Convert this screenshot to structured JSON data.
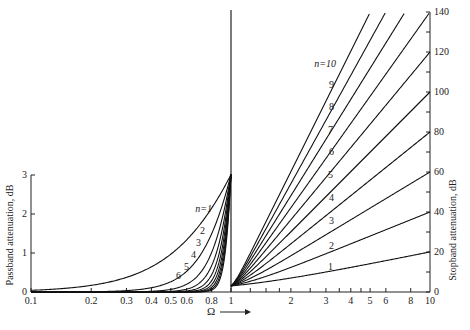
{
  "chart_data": {
    "type": "line",
    "title": "",
    "xlabel": "Ω",
    "formula": "A(Ω) = 10·log10(1 + Ω^(2n)) dB (Butterworth)",
    "panels": [
      {
        "name": "passband",
        "ylabel": "Passband attenuation, dB",
        "x_scale": "log",
        "xlim": [
          0.1,
          1
        ],
        "ylim": [
          0,
          3
        ],
        "x_ticks": [
          0.1,
          0.2,
          0.3,
          0.4,
          0.5,
          0.6,
          0.8,
          1
        ],
        "x_tick_labels": [
          "0.1",
          "0.2",
          "0.3",
          "0.4",
          "0.5",
          "0.6",
          "0.8",
          "1"
        ],
        "y_ticks": [
          0,
          1,
          2,
          3
        ],
        "y_tick_labels": [
          "0",
          "1",
          "2",
          "3"
        ],
        "series": [
          {
            "name": "n=1",
            "n": 1,
            "values_at_ticks": [
              0.04,
              0.17,
              0.37,
              0.64,
              0.97,
              1.34,
              2.15,
              3.01
            ]
          },
          {
            "name": "2",
            "n": 2,
            "values_at_ticks": [
              0.0,
              0.01,
              0.04,
              0.11,
              0.26,
              0.53,
              1.35,
              3.01
            ]
          },
          {
            "name": "3",
            "n": 3,
            "values_at_ticks": [
              0.0,
              0.0,
              0.0,
              0.02,
              0.07,
              0.2,
              0.9,
              3.01
            ]
          },
          {
            "name": "4",
            "n": 4,
            "values_at_ticks": [
              0.0,
              0.0,
              0.0,
              0.0,
              0.02,
              0.07,
              0.6,
              3.01
            ]
          },
          {
            "name": "5",
            "n": 5,
            "values_at_ticks": [
              0.0,
              0.0,
              0.0,
              0.0,
              0.0,
              0.03,
              0.39,
              3.01
            ]
          },
          {
            "name": "6",
            "n": 6,
            "values_at_ticks": [
              0.0,
              0.0,
              0.0,
              0.0,
              0.0,
              0.01,
              0.25,
              3.01
            ]
          }
        ],
        "curve_labels": [
          {
            "text": "n=1",
            "n": 1
          },
          {
            "text": "2",
            "n": 2
          },
          {
            "text": "3",
            "n": 3
          },
          {
            "text": "4",
            "n": 4
          },
          {
            "text": "5",
            "n": 5
          },
          {
            "text": "6",
            "n": 6
          }
        ],
        "extra_curves_n": [
          7,
          8,
          9,
          10
        ]
      },
      {
        "name": "stopband",
        "ylabel": "Stopband attenuation, dB",
        "x_scale": "log",
        "xlim": [
          1,
          10
        ],
        "ylim": [
          0,
          140
        ],
        "x_ticks": [
          1,
          2,
          3,
          4,
          5,
          6,
          8,
          10
        ],
        "x_tick_labels": [
          "1",
          "2",
          "3",
          "4",
          "5",
          "6",
          "8",
          "10"
        ],
        "y_ticks": [
          0,
          20,
          40,
          60,
          80,
          100,
          120,
          140
        ],
        "y_tick_labels": [
          "0",
          "20",
          "40",
          "60",
          "80",
          "100",
          "120",
          "140"
        ],
        "series": [
          {
            "name": "1",
            "n": 1,
            "value_at_10": 20
          },
          {
            "name": "2",
            "n": 2,
            "value_at_10": 40
          },
          {
            "name": "3",
            "n": 3,
            "value_at_10": 60
          },
          {
            "name": "4",
            "n": 4,
            "value_at_10": 80
          },
          {
            "name": "5",
            "n": 5,
            "value_at_10": 100
          },
          {
            "name": "6",
            "n": 6,
            "value_at_10": 120
          },
          {
            "name": "7",
            "n": 7,
            "value_at_10": 140
          },
          {
            "name": "8",
            "n": 8,
            "value_at_10": 160
          },
          {
            "name": "9",
            "n": 9,
            "value_at_10": 180
          },
          {
            "name": "n=10",
            "n": 10,
            "value_at_10": 200
          }
        ]
      }
    ],
    "axis_arrow_label": "Ω"
  },
  "labels": {
    "passband_ylabel": "Passband attenuation, dB",
    "stopband_ylabel": "Stopband attenuation, dB",
    "omega": "Ω"
  }
}
